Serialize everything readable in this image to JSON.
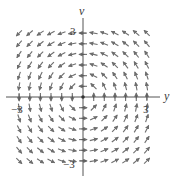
{
  "figure": {
    "type": "vector_field",
    "field": {
      "dx": "-v",
      "dy": "y",
      "description": "counterclockwise rotation about origin"
    },
    "axes": {
      "horizontal_label": "y",
      "vertical_label": "v",
      "ticks": {
        "x_pos": "3",
        "x_neg": "−3",
        "y_pos": "3",
        "y_neg": "−3"
      },
      "range": [
        -3.4,
        3.4
      ]
    },
    "grid": {
      "min": -3,
      "max": 3,
      "step": 0.5
    },
    "colors": {
      "arrow": "#6e6e6e",
      "axis": "#555555",
      "label": "#3a3a3a",
      "background": "#ffffff"
    }
  }
}
